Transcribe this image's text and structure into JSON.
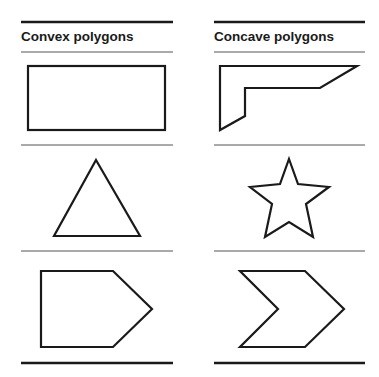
{
  "columns": [
    {
      "id": "convex",
      "header": "Convex polygons",
      "shapes": [
        "rectangle",
        "triangle",
        "pentagon"
      ]
    },
    {
      "id": "concave",
      "header": "Concave polygons",
      "shapes": [
        "l-shape",
        "star",
        "chevron"
      ]
    }
  ],
  "colors": {
    "stroke": "#1a1a1a",
    "divider": "#555555",
    "background": "#ffffff"
  }
}
